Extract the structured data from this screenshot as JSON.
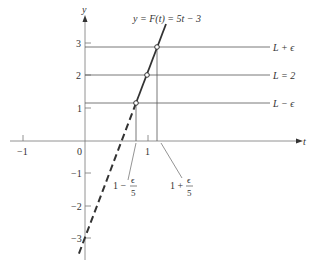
{
  "figure": {
    "type": "function-limit-diagram",
    "title": "y = F(t) = 5t − 3",
    "axes": {
      "x_label": "t",
      "y_label": "y",
      "x_ticks": [
        "−1",
        "0",
        "1"
      ],
      "y_ticks": [
        "3",
        "2",
        "1",
        "−1",
        "−2",
        "−3"
      ]
    },
    "horizontal_lines": {
      "upper": "L + ϵ",
      "middle": "L = 2",
      "lower": "L − ϵ"
    },
    "interval_labels": {
      "left": {
        "prefix": "1 −",
        "num": "ϵ",
        "den": "5"
      },
      "right": {
        "prefix": "1 +",
        "num": "ϵ",
        "den": "5"
      }
    },
    "function": {
      "slope": 5,
      "intercept": -3,
      "L": 2,
      "a": 1
    }
  }
}
